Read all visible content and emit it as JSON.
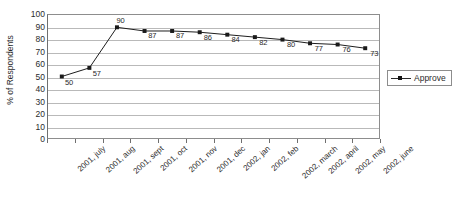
{
  "chart_data": {
    "type": "line",
    "title": "",
    "xlabel": "",
    "ylabel": "% of Respondents",
    "ylim": [
      0,
      100
    ],
    "y_ticks": [
      0,
      10,
      20,
      30,
      40,
      50,
      60,
      70,
      80,
      90,
      100
    ],
    "grid": true,
    "legend_position": "right",
    "categories": [
      "2001, july",
      "2001, aug",
      "2001, sept",
      "2001, oct",
      "2001, nov",
      "2001, dec",
      "2002, jan",
      "2002, feb",
      "2002, march",
      "2002, april",
      "2002, may",
      "2002, june"
    ],
    "series": [
      {
        "name": "Approve",
        "values": [
          50,
          57,
          90,
          87,
          87,
          86,
          84,
          82,
          80,
          77,
          76,
          73
        ],
        "marker": "square",
        "color": "#1a1a1a"
      }
    ],
    "data_labels": [
      "50",
      "57",
      "90",
      "87",
      "87",
      "86",
      "84",
      "82",
      "80",
      "77",
      "76",
      "73"
    ]
  },
  "legend": {
    "entries": [
      {
        "label": "Approve"
      }
    ]
  }
}
